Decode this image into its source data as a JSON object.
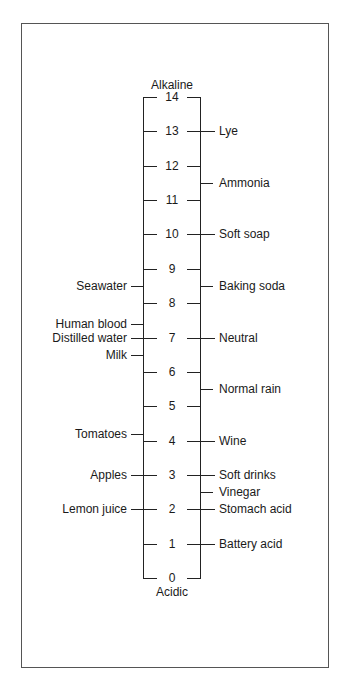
{
  "top_label": "Alkaline",
  "bottom_label": "Acidic",
  "scale": {
    "min": 0,
    "max": 14,
    "ticks": [
      "0",
      "1",
      "2",
      "3",
      "4",
      "5",
      "6",
      "7",
      "8",
      "9",
      "10",
      "11",
      "12",
      "13",
      "14"
    ]
  },
  "right_labels": [
    {
      "text": "Lye",
      "ph": 13
    },
    {
      "text": "Ammonia",
      "ph": 11.5
    },
    {
      "text": "Soft soap",
      "ph": 10
    },
    {
      "text": "Baking soda",
      "ph": 8.5
    },
    {
      "text": "Neutral",
      "ph": 7
    },
    {
      "text": "Normal rain",
      "ph": 5.5
    },
    {
      "text": "Wine",
      "ph": 4
    },
    {
      "text": "Soft drinks",
      "ph": 3
    },
    {
      "text": "Vinegar",
      "ph": 2.5
    },
    {
      "text": "Stomach acid",
      "ph": 2
    },
    {
      "text": "Battery acid",
      "ph": 1
    }
  ],
  "left_labels": [
    {
      "text": "Seawater",
      "ph": 8.5
    },
    {
      "text": "Human blood",
      "ph": 7.4
    },
    {
      "text": "Distilled water",
      "ph": 7
    },
    {
      "text": "Milk",
      "ph": 6.5
    },
    {
      "text": "Tomatoes",
      "ph": 4.2
    },
    {
      "text": "Apples",
      "ph": 3
    },
    {
      "text": "Lemon juice",
      "ph": 2
    }
  ]
}
